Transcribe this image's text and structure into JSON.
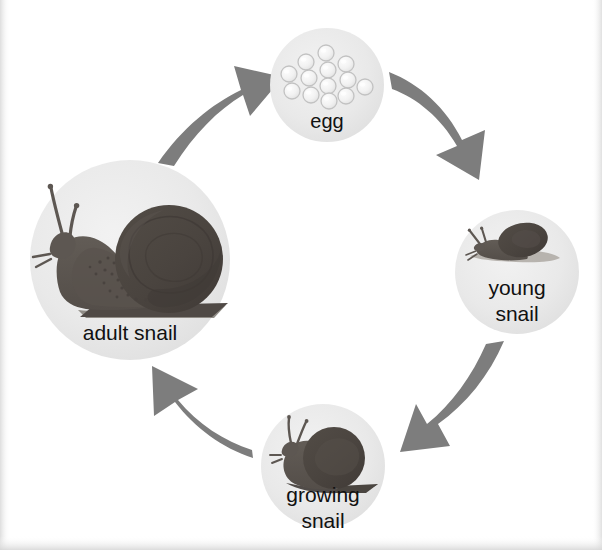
{
  "diagram": {
    "type": "circular-life-cycle",
    "background_color": "#ffffff",
    "circle_fill_color": "#e7e7e7",
    "arrow_color": "#7d7d7d",
    "snail_body_color": "#5d5752",
    "snail_shell_color": "#4b4540",
    "label_color": "#111111",
    "direction": "clockwise",
    "stage_count": 4
  },
  "stages": [
    {
      "id": "egg",
      "label": "egg",
      "label_lines": [
        "egg"
      ],
      "order": 1,
      "center_x": 327,
      "center_y": 85,
      "radius": 57,
      "egg_count": 13,
      "icon": "snail-eggs-cluster-icon"
    },
    {
      "id": "young-snail",
      "label": "young snail",
      "label_lines": [
        "young",
        "snail"
      ],
      "order": 2,
      "center_x": 517,
      "center_y": 272,
      "radius": 62,
      "icon": "young-snail-icon"
    },
    {
      "id": "growing-snail",
      "label": "growing snail",
      "label_lines": [
        "growing",
        "snail"
      ],
      "order": 3,
      "center_x": 323,
      "center_y": 466,
      "radius": 62,
      "icon": "growing-snail-icon"
    },
    {
      "id": "adult-snail",
      "label": "adult snail",
      "label_lines": [
        "adult snail"
      ],
      "order": 4,
      "center_x": 130,
      "center_y": 260,
      "radius": 100,
      "icon": "adult-snail-icon"
    }
  ],
  "arrows": [
    {
      "id": "arrow-adult-to-egg",
      "from": "adult-snail",
      "to": "egg",
      "direction": "up-right"
    },
    {
      "id": "arrow-egg-to-young",
      "from": "egg",
      "to": "young-snail",
      "direction": "down-right"
    },
    {
      "id": "arrow-young-to-growing",
      "from": "young-snail",
      "to": "growing-snail",
      "direction": "down-left"
    },
    {
      "id": "arrow-growing-to-adult",
      "from": "growing-snail",
      "to": "adult-snail",
      "direction": "up-left"
    }
  ]
}
